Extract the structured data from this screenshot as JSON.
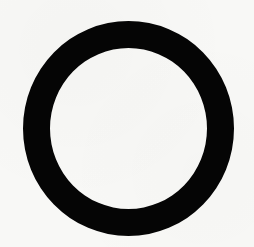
{
  "figure": {
    "shape": "ring",
    "description": "Thick black ring (circle outline) on off-white background",
    "colors": {
      "stroke": "#050505",
      "background": "#f8f8f6"
    }
  }
}
